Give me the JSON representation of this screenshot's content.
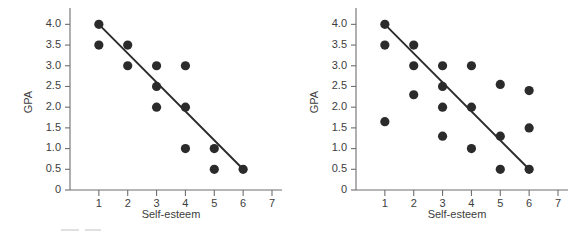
{
  "figure": {
    "background_color": "#ffffff",
    "point_color": "#2b2b2b",
    "line_color": "#2b2b2b",
    "axis_color": "#6e6e6e",
    "text_color": "#3d3d3d"
  },
  "panels": [
    {
      "name": "left-panel"
    },
    {
      "name": "right-panel"
    }
  ],
  "chart_data": [
    {
      "type": "scatter",
      "title": "",
      "xlabel": "Self-esteem",
      "ylabel": "GPA",
      "xlim": [
        0,
        7
      ],
      "ylim": [
        0,
        4.25
      ],
      "grid": false,
      "legend": false,
      "xticks": [
        1,
        2,
        3,
        4,
        5,
        6,
        7
      ],
      "xticklabels": [
        "1",
        "2",
        "3",
        "4",
        "5",
        "6",
        "7"
      ],
      "yticks": [
        0,
        0.5,
        1.0,
        1.5,
        2.0,
        2.5,
        3.0,
        3.5,
        4.0
      ],
      "yticklabels": [
        "0",
        "0.5",
        "1.0",
        "1.5",
        "2.0",
        "2.5",
        "3.0",
        "3.5",
        "4.0"
      ],
      "points": [
        {
          "x": 1,
          "y": 4.0
        },
        {
          "x": 1,
          "y": 3.5
        },
        {
          "x": 2,
          "y": 3.5
        },
        {
          "x": 2,
          "y": 3.0
        },
        {
          "x": 3,
          "y": 3.0
        },
        {
          "x": 3,
          "y": 2.5
        },
        {
          "x": 3,
          "y": 2.0
        },
        {
          "x": 4,
          "y": 3.0
        },
        {
          "x": 4,
          "y": 2.0
        },
        {
          "x": 4,
          "y": 1.0
        },
        {
          "x": 5,
          "y": 1.0
        },
        {
          "x": 5,
          "y": 0.5
        },
        {
          "x": 6,
          "y": 0.5
        }
      ],
      "fit_line": {
        "x0": 1,
        "y0": 4.0,
        "x1": 6,
        "y1": 0.5
      }
    },
    {
      "type": "scatter",
      "title": "",
      "xlabel": "Self-esteem",
      "ylabel": "GPA",
      "xlim": [
        0,
        7
      ],
      "ylim": [
        0,
        4.25
      ],
      "grid": false,
      "legend": false,
      "xticks": [
        1,
        2,
        3,
        4,
        5,
        6,
        7
      ],
      "xticklabels": [
        "1",
        "2",
        "3",
        "4",
        "5",
        "6",
        "7"
      ],
      "yticks": [
        0,
        0.5,
        1.0,
        1.5,
        2.0,
        2.5,
        3.0,
        3.5,
        4.0
      ],
      "yticklabels": [
        "0",
        "0.5",
        "1.0",
        "1.5",
        "2.0",
        "2.5",
        "3.0",
        "3.5",
        "4.0"
      ],
      "points": [
        {
          "x": 1,
          "y": 4.0
        },
        {
          "x": 1,
          "y": 3.5
        },
        {
          "x": 1,
          "y": 1.65
        },
        {
          "x": 2,
          "y": 3.5
        },
        {
          "x": 2,
          "y": 3.0
        },
        {
          "x": 2,
          "y": 2.3
        },
        {
          "x": 3,
          "y": 3.0
        },
        {
          "x": 3,
          "y": 2.5
        },
        {
          "x": 3,
          "y": 2.0
        },
        {
          "x": 3,
          "y": 1.3
        },
        {
          "x": 4,
          "y": 3.0
        },
        {
          "x": 4,
          "y": 2.0
        },
        {
          "x": 4,
          "y": 1.0
        },
        {
          "x": 5,
          "y": 2.55
        },
        {
          "x": 5,
          "y": 1.3
        },
        {
          "x": 5,
          "y": 0.5
        },
        {
          "x": 6,
          "y": 2.4
        },
        {
          "x": 6,
          "y": 1.5
        },
        {
          "x": 6,
          "y": 0.5
        }
      ],
      "fit_line": {
        "x0": 1,
        "y0": 4.0,
        "x1": 6,
        "y1": 0.5
      }
    }
  ]
}
